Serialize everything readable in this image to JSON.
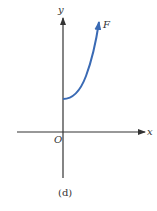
{
  "figure": {
    "caption": "(d)",
    "axes": {
      "x_label": "x",
      "y_label": "y",
      "origin_label": "O"
    },
    "curve": {
      "label": "F",
      "color": "#3a6ab4",
      "description": "increasing, concave-up curve starting on the positive y-axis, ending in an arrow"
    },
    "axis_color": "#333333"
  }
}
